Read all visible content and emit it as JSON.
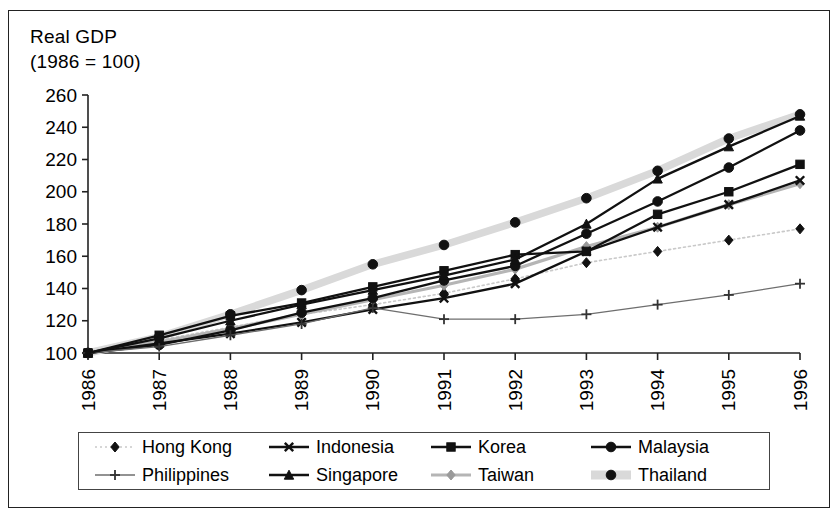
{
  "chart_data": {
    "type": "line",
    "title": "Real GDP\n(1986 = 100)",
    "title_line1": "Real GDP",
    "title_line2": "(1986 = 100)",
    "xlabel": "",
    "ylabel": "",
    "ylim": [
      100,
      260
    ],
    "ytick_step": 20,
    "yticks": [
      100,
      120,
      140,
      160,
      180,
      200,
      220,
      240,
      260
    ],
    "categories": [
      "1986",
      "1987",
      "1988",
      "1989",
      "1990",
      "1991",
      "1992",
      "1993",
      "1994",
      "1995",
      "1996"
    ],
    "x": [
      1986,
      1987,
      1988,
      1989,
      1990,
      1991,
      1992,
      1993,
      1994,
      1995,
      1996
    ],
    "grid": false,
    "legend_position": "bottom",
    "legend_columns": 4,
    "series": [
      {
        "name": "Hong Kong",
        "marker": "diamond",
        "line": "dotted",
        "color": "#c9c9c9",
        "marker_color": "#111111",
        "values": [
          100,
          108,
          116,
          124,
          130,
          137,
          146,
          156,
          163,
          170,
          177
        ]
      },
      {
        "name": "Indonesia",
        "marker": "x",
        "line": "solid",
        "color": "#111111",
        "marker_color": "#111111",
        "values": [
          100,
          106,
          112,
          119,
          127,
          134,
          143,
          163,
          178,
          192,
          207
        ]
      },
      {
        "name": "Korea",
        "marker": "square",
        "line": "solid",
        "color": "#111111",
        "marker_color": "#111111",
        "values": [
          100,
          111,
          123,
          131,
          141,
          151,
          161,
          163,
          186,
          200,
          217
        ]
      },
      {
        "name": "Malaysia",
        "marker": "circle",
        "line": "solid",
        "color": "#111111",
        "marker_color": "#111111",
        "values": [
          100,
          105,
          114,
          125,
          134,
          145,
          154,
          174,
          194,
          215,
          238
        ]
      },
      {
        "name": "Philippines",
        "marker": "plus",
        "line": "solid",
        "color": "#6e6e6e",
        "marker_color": "#333333",
        "values": [
          100,
          104,
          111,
          118,
          128,
          121,
          121,
          124,
          130,
          136,
          143
        ]
      },
      {
        "name": "Singapore",
        "marker": "triangle",
        "line": "solid",
        "color": "#111111",
        "marker_color": "#111111",
        "values": [
          100,
          109,
          120,
          130,
          139,
          148,
          158,
          180,
          208,
          228,
          247
        ]
      },
      {
        "name": "Taiwan",
        "marker": "diamond",
        "line": "solid",
        "color": "#b5b5b5",
        "marker_color": "#9a9a9a",
        "values": [
          100,
          107,
          115,
          124,
          133,
          142,
          152,
          166,
          178,
          192,
          205
        ]
      },
      {
        "name": "Thailand",
        "marker": "circle",
        "line": "thick-light",
        "color": "#d9d9d9",
        "marker_color": "#111111",
        "values": [
          100,
          110,
          124,
          139,
          155,
          167,
          181,
          196,
          213,
          233,
          248
        ]
      }
    ]
  },
  "axes": {
    "y_tick_labels": [
      "260",
      "240",
      "220",
      "200",
      "180",
      "160",
      "140",
      "120",
      "100"
    ],
    "x_tick_labels": [
      "1986",
      "1987",
      "1988",
      "1989",
      "1990",
      "1991",
      "1992",
      "1993",
      "1994",
      "1995",
      "1996"
    ]
  },
  "legend": {
    "items": [
      {
        "label": "Hong Kong"
      },
      {
        "label": "Indonesia"
      },
      {
        "label": "Korea"
      },
      {
        "label": "Malaysia"
      },
      {
        "label": "Philippines"
      },
      {
        "label": "Singapore"
      },
      {
        "label": "Taiwan"
      },
      {
        "label": "Thailand"
      }
    ]
  }
}
